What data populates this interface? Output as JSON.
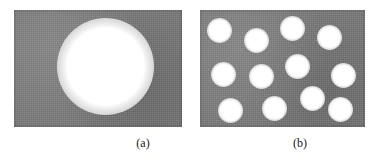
{
  "figure": {
    "type": "micrograph-pair",
    "width": 379,
    "height": 164,
    "background_color": "#ffffff",
    "matrix_color": "#787878",
    "pore_core_color": "#ffffff",
    "pore_halo_color": "#c8c8c8"
  },
  "panels": [
    {
      "id": "a",
      "caption": "(a)",
      "caption_x": 98,
      "caption_y": 136,
      "caption_width": 90,
      "rect": {
        "x": 14,
        "y": 10,
        "w": 168,
        "h": 117
      },
      "description": "single large pore",
      "pore_count": 1,
      "pores": [
        {
          "cx": 105,
          "cy": 66,
          "d": 97
        }
      ]
    },
    {
      "id": "b",
      "caption": "(b)",
      "caption_x": 255,
      "caption_y": 136,
      "caption_width": 90,
      "rect": {
        "x": 200,
        "y": 10,
        "w": 165,
        "h": 117
      },
      "description": "many small dispersed pores",
      "pore_count": 12,
      "pores": [
        {
          "cx": 219,
          "cy": 30,
          "d": 25
        },
        {
          "cx": 256,
          "cy": 40,
          "d": 25
        },
        {
          "cx": 292,
          "cy": 28,
          "d": 25
        },
        {
          "cx": 329,
          "cy": 37,
          "d": 25
        },
        {
          "cx": 223,
          "cy": 74,
          "d": 25
        },
        {
          "cx": 261,
          "cy": 76,
          "d": 25
        },
        {
          "cx": 297,
          "cy": 66,
          "d": 25
        },
        {
          "cx": 343,
          "cy": 75,
          "d": 25
        },
        {
          "cx": 230,
          "cy": 110,
          "d": 25
        },
        {
          "cx": 274,
          "cy": 108,
          "d": 25
        },
        {
          "cx": 312,
          "cy": 98,
          "d": 25
        },
        {
          "cx": 340,
          "cy": 109,
          "d": 25
        }
      ]
    }
  ]
}
